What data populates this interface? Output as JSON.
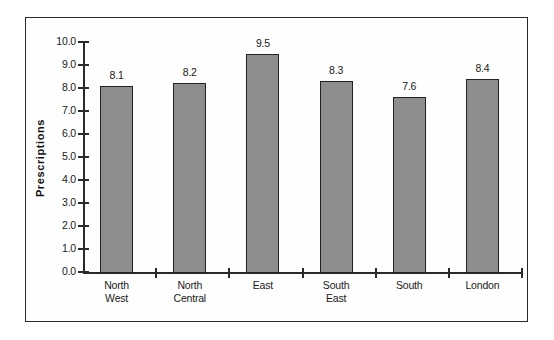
{
  "chart_data": {
    "type": "bar",
    "title": "",
    "xlabel": "",
    "ylabel": "Prescriptions",
    "ylim": [
      0.0,
      10.0
    ],
    "ytick_step": 1.0,
    "grid": false,
    "legend": null,
    "categories": [
      "North West",
      "North Central",
      "East",
      "South East",
      "South",
      "London"
    ],
    "category_lines": [
      [
        "North",
        "West"
      ],
      [
        "North",
        "Central"
      ],
      [
        "East",
        ""
      ],
      [
        "South",
        "East"
      ],
      [
        "South",
        ""
      ],
      [
        "London",
        ""
      ]
    ],
    "values": [
      8.1,
      8.2,
      9.5,
      8.3,
      7.6,
      8.4
    ],
    "value_labels": [
      "8.1",
      "8.2",
      "9.5",
      "8.3",
      "7.6",
      "8.4"
    ],
    "ytick_labels": [
      "0.0",
      "1.0",
      "2.0",
      "3.0",
      "4.0",
      "5.0",
      "6.0",
      "7.0",
      "8.0",
      "9.0",
      "10.0"
    ],
    "bar_fill_color": "#8e8e8e",
    "bar_edge_color": "#232323",
    "axis_color": "#2a2a2a",
    "background_color": "#ffffff",
    "frame_color": "#2a2a2a"
  }
}
